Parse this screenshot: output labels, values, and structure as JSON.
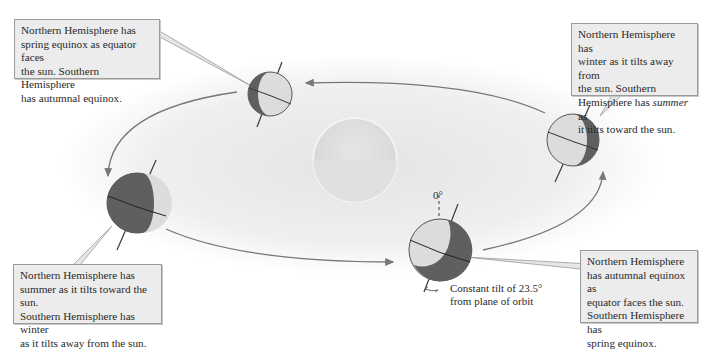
{
  "diagram": {
    "type": "seasons-earth-orbit",
    "sun": {
      "name": "sun",
      "color": "#e2e2e2"
    },
    "orbit": {
      "direction": "counter-clockwise-in-view",
      "arrow_color": "#777777",
      "glow_color": "#ececec"
    },
    "earth": {
      "dark_color": "#5f5f5f",
      "light_color": "#dcdcdc",
      "axis_color": "#3a3a3a"
    },
    "positions": [
      {
        "id": "top",
        "season_north": "spring equinox"
      },
      {
        "id": "right",
        "season_north": "winter"
      },
      {
        "id": "bottom",
        "season_north": "autumnal equinox"
      },
      {
        "id": "left",
        "season_north": "summer"
      }
    ]
  },
  "callouts": {
    "top_left": {
      "line1": "Northern Hemisphere has",
      "line2": "spring equinox as equator faces",
      "line3": "the sun. Southern Hemisphere",
      "line4": "has autumnal equinox."
    },
    "top_right": {
      "line1": "Northern Hemisphere has",
      "line2": "winter as it tilts away from",
      "line3": "the sun. Southern",
      "line4_pre": "Hemisphere has ",
      "line4_em": "summer",
      "line4_post": " as",
      "line5": "it tilts toward the sun."
    },
    "bottom_left": {
      "line1": "Northern Hemisphere has",
      "line2": "summer as it tilts toward the sun.",
      "line3": "Southern Hemisphere has winter",
      "line4": "as it tilts away from the sun."
    },
    "bottom_right": {
      "line1": "Northern Hemisphere",
      "line2": "has autumnal equinox as",
      "line3": "equator faces the sun.",
      "line4": "Southern Hemisphere has",
      "line5": "spring equinox."
    }
  },
  "labels": {
    "zero_degree": "0°",
    "tilt_line1": "Constant tilt of 23.5°",
    "tilt_line2": "from plane of orbit"
  }
}
